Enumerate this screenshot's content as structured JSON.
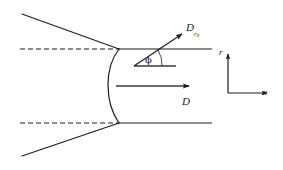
{
  "figure": {
    "type": "technical-line-diagram",
    "background_color": "#ffffff",
    "line_color": "#1a1a1a",
    "labels": {
      "normal_velocity": {
        "text": "D",
        "subscript": "r",
        "subsubscript": "0",
        "full": "Dr0"
      },
      "axial_velocity": {
        "text": "D"
      },
      "angle": {
        "text": "ϕ"
      },
      "axis_vertical": {
        "text": "r"
      },
      "axis_horizontal": {
        "text": "x"
      }
    },
    "geometry": {
      "shock_vertex": {
        "x": 108,
        "y": 85
      },
      "upper_junction": {
        "x": 119,
        "y": 49
      },
      "lower_junction": {
        "x": 119,
        "y": 123
      },
      "upper_asymptote_start": {
        "x": 22,
        "y": 14
      },
      "lower_asymptote_start": {
        "x": 22,
        "y": 156
      },
      "upper_dashed_line": {
        "x1": 20,
        "y1": 49,
        "x2": 119,
        "y2": 49
      },
      "lower_dashed_line": {
        "x1": 20,
        "y1": 123,
        "x2": 119,
        "y2": 123
      },
      "upper_solid_line": {
        "x1": 119,
        "y1": 49,
        "x2": 212,
        "y2": 49
      },
      "lower_solid_line": {
        "x1": 119,
        "y1": 123,
        "x2": 212,
        "y2": 123
      },
      "inclined_arrow": {
        "x1": 134,
        "y1": 66,
        "x2": 183,
        "y2": 33
      },
      "axial_arrow": {
        "x1": 117,
        "y1": 86,
        "x2": 190,
        "y2": 86
      },
      "angle_reference_segment": {
        "x1": 134,
        "y1": 66,
        "x2": 176,
        "y2": 66
      },
      "axes_origin": {
        "x": 228,
        "y": 93
      },
      "axes_vertical_tip": {
        "x": 228,
        "y": 53
      },
      "axes_horizontal_tip": {
        "x": 268,
        "y": 93
      }
    }
  }
}
